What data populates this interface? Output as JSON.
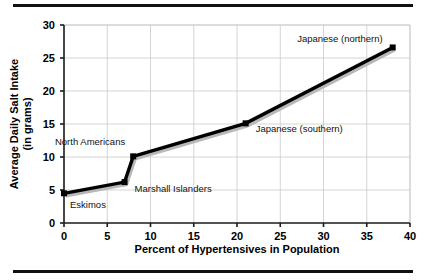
{
  "figure": {
    "top_rule": "",
    "bottom_rule": ""
  },
  "chart_data": {
    "type": "line",
    "title": "",
    "xlabel": "Percent of Hypertensives in Population",
    "ylabel": "Average Daily Salt Intake",
    "ylabel_line1": "Average Daily Salt Intake",
    "ylabel_line2": "(in grams)",
    "xlim": [
      0,
      40
    ],
    "ylim": [
      0,
      30
    ],
    "xticks": [
      0,
      5,
      10,
      15,
      20,
      25,
      30,
      35,
      40
    ],
    "yticks": [
      0,
      5,
      10,
      15,
      20,
      25,
      30
    ],
    "xtick_labels": [
      "0",
      "5",
      "10",
      "15",
      "20",
      "25",
      "30",
      "35",
      "40"
    ],
    "ytick_labels": [
      "0",
      "5",
      "10",
      "15",
      "20",
      "25",
      "30"
    ],
    "grid": true,
    "legend": "none",
    "series": [
      {
        "name": "Salt intake vs hypertension",
        "x": [
          0,
          7,
          8,
          21,
          38
        ],
        "y": [
          4.5,
          6.2,
          10.1,
          15.1,
          26.6
        ],
        "point_labels": [
          "Eskimos",
          "Marshall Islanders",
          "North Americans",
          "Japanese (southern)",
          "Japanese (northern)"
        ]
      }
    ],
    "annotations": [
      {
        "text": "Eskimos",
        "x": 0,
        "y": 4.5
      },
      {
        "text": "Marshall Islanders",
        "x": 7,
        "y": 6.2
      },
      {
        "text": "North Americans",
        "x": 8,
        "y": 10.1
      },
      {
        "text": "Japanese (southern)",
        "x": 21,
        "y": 15.1
      },
      {
        "text": "Japanese (northern)",
        "x": 38,
        "y": 26.6
      }
    ],
    "colors": {
      "line": "#000000",
      "line_shadow": "#b8b8b8",
      "grid": "#c9c9c9",
      "axis": "#1a1a1a",
      "text": "#000000",
      "background": "#ffffff"
    }
  }
}
